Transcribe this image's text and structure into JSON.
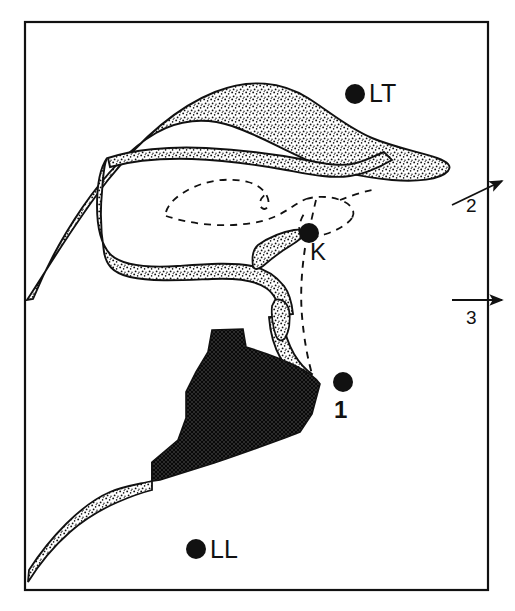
{
  "figure": {
    "type": "anatomical-line-diagram",
    "background_color": "#ffffff",
    "ink_color": "#111111",
    "frame": {
      "x": 25,
      "y": 22,
      "width": 463,
      "height": 568,
      "stroke": "#111111",
      "stroke_width": 2
    }
  },
  "markers": [
    {
      "id": "LT",
      "label": "LT",
      "cx": 355,
      "cy": 94,
      "r": 10,
      "label_x": 369,
      "label_y": 81,
      "color": "#111111"
    },
    {
      "id": "K",
      "label": "K",
      "cx": 309,
      "cy": 233,
      "r": 10,
      "label_x": 310,
      "label_y": 240,
      "color": "#111111"
    },
    {
      "id": "1",
      "label": "1",
      "cx": 343,
      "cy": 382,
      "r": 10,
      "label_x": 334,
      "label_y": 398,
      "color": "#111111"
    },
    {
      "id": "LL",
      "label": "LL",
      "cx": 196,
      "cy": 549,
      "r": 10,
      "label_x": 210,
      "label_y": 537,
      "color": "#111111"
    }
  ],
  "arrows": [
    {
      "id": "2",
      "label": "2",
      "x1": 452,
      "y1": 204,
      "x2": 503,
      "y2": 181,
      "label_x": 466,
      "label_y": 196,
      "orientation": "up-right"
    },
    {
      "id": "3",
      "label": "3",
      "x1": 452,
      "y1": 300,
      "x2": 503,
      "y2": 300,
      "label_x": 466,
      "label_y": 308,
      "orientation": "horizontal"
    }
  ],
  "regions": [
    {
      "name": "tongue-body",
      "style": "solid-dark-crosshatch",
      "fill": "#2b2b2b"
    },
    {
      "name": "palate-band",
      "style": "stippled-outline"
    },
    {
      "name": "mandible-band",
      "style": "stippled-outline"
    },
    {
      "name": "pharyngeal-wall-band",
      "style": "stippled-outline"
    },
    {
      "name": "uvula-wedge",
      "style": "stippled-outline"
    },
    {
      "name": "epiglottis-wedge",
      "style": "stippled-outline"
    },
    {
      "name": "dashed-contours",
      "style": "dashed-line"
    },
    {
      "name": "k-trace-line",
      "style": "dashed-line"
    }
  ]
}
